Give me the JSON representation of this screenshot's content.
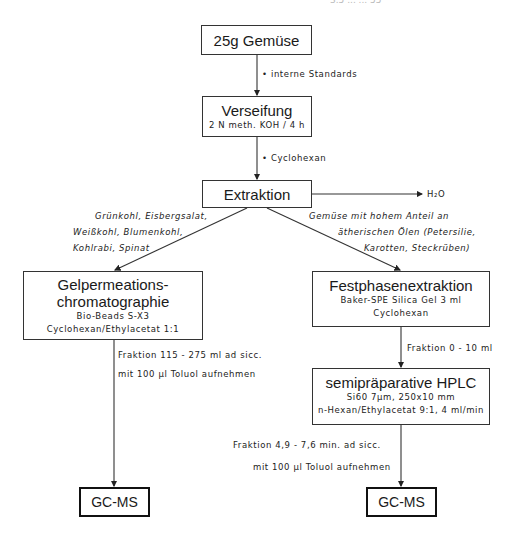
{
  "header": {
    "running_head": "3.5 ... ... 55"
  },
  "nodes": {
    "sample": {
      "title": "25g Gemüse"
    },
    "saponification": {
      "title": "Verseifung",
      "detail": "2 N meth. KOH / 4 h"
    },
    "extraction": {
      "title": "Extraktion"
    },
    "gpc": {
      "title_line1": "Gelpermeations-",
      "title_line2": "chromatographie",
      "detail1": "Bio-Beads S-X3",
      "detail2": "Cyclohexan/Ethylacetat 1:1"
    },
    "spe": {
      "title": "Festphasenextraktion",
      "detail1": "Baker-SPE Silica Gel 3 ml",
      "detail2": "Cyclohexan"
    },
    "hplc": {
      "title": "semipräparative HPLC",
      "detail1": "Si60 7µm, 250x10 mm",
      "detail2": "n-Hexan/Ethylacetat 9:1, 4 ml/min"
    },
    "gcms_left": {
      "title": "GC-MS"
    },
    "gcms_right": {
      "title": "GC-MS"
    }
  },
  "edge_labels": {
    "internal_standards": "• interne Standards",
    "cyclohexane": "• Cyclohexan",
    "water": "H₂O",
    "left_branch": [
      "Grünkohl, Eisbergsalat,",
      "Weißkohl, Blumenkohl,",
      "Kohlrabi, Spinat"
    ],
    "right_branch": [
      "Gemüse mit hohem Anteil an",
      "ätherischen Ölen (Petersilie,",
      "Karotten, Steckrüben)"
    ],
    "gpc_fraction": [
      "Fraktion 115 - 275 ml ad sicc.",
      "mit 100 µl Toluol aufnehmen"
    ],
    "spe_fraction": "Fraktion 0 - 10 ml",
    "hplc_fraction": [
      "Fraktion 4,9 - 7,6 min. ad sicc.",
      "mit 100 µl Toluol aufnehmen"
    ]
  }
}
